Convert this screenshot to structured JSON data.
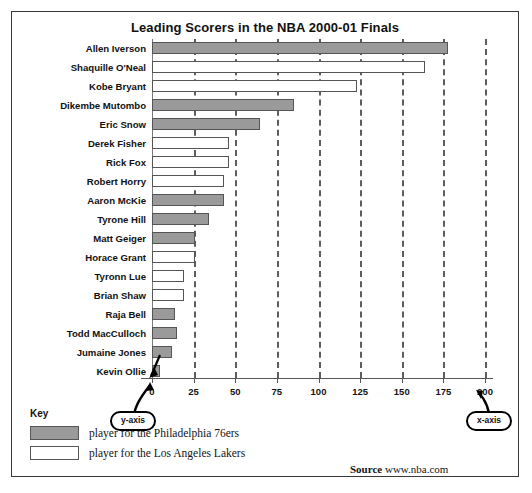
{
  "chart_data": {
    "type": "bar",
    "orientation": "horizontal",
    "title": "Leading Scorers in the NBA 2000-01 Finals",
    "xlabel": "",
    "ylabel": "",
    "xlim": [
      0,
      200
    ],
    "xticks": [
      0,
      25,
      50,
      75,
      100,
      125,
      150,
      175,
      200
    ],
    "grid": "vertical dashed gridlines at each x tick",
    "legend_position": "bottom-left",
    "categories": [
      "Allen Iverson",
      "Shaquille O'Neal",
      "Kobe Bryant",
      "Dikembe Mutombo",
      "Eric Snow",
      "Derek Fisher",
      "Rick Fox",
      "Robert Horry",
      "Aaron McKie",
      "Tyrone Hill",
      "Matt Geiger",
      "Horace Grant",
      "Tyronn Lue",
      "Brian Shaw",
      "Raja Bell",
      "Todd MacCulloch",
      "Jumaine Jones",
      "Kevin Ollie"
    ],
    "values": [
      178,
      164,
      123,
      85,
      65,
      46,
      46,
      43,
      43,
      34,
      26,
      26,
      19,
      19,
      14,
      15,
      12,
      5
    ],
    "teams": [
      "sixers",
      "lakers",
      "lakers",
      "sixers",
      "sixers",
      "lakers",
      "lakers",
      "lakers",
      "sixers",
      "sixers",
      "sixers",
      "lakers",
      "lakers",
      "lakers",
      "sixers",
      "sixers",
      "sixers",
      "sixers"
    ],
    "bars": [
      {
        "label": "Allen Iverson",
        "value": 178,
        "team": "sixers"
      },
      {
        "label": "Shaquille O'Neal",
        "value": 164,
        "team": "lakers"
      },
      {
        "label": "Kobe Bryant",
        "value": 123,
        "team": "lakers"
      },
      {
        "label": "Dikembe Mutombo",
        "value": 85,
        "team": "sixers"
      },
      {
        "label": "Eric Snow",
        "value": 65,
        "team": "sixers"
      },
      {
        "label": "Derek Fisher",
        "value": 46,
        "team": "lakers"
      },
      {
        "label": "Rick Fox",
        "value": 46,
        "team": "lakers"
      },
      {
        "label": "Robert Horry",
        "value": 43,
        "team": "lakers"
      },
      {
        "label": "Aaron McKie",
        "value": 43,
        "team": "sixers"
      },
      {
        "label": "Tyrone Hill",
        "value": 34,
        "team": "sixers"
      },
      {
        "label": "Matt Geiger",
        "value": 26,
        "team": "sixers"
      },
      {
        "label": "Horace Grant",
        "value": 26,
        "team": "lakers"
      },
      {
        "label": "Tyronn Lue",
        "value": 19,
        "team": "lakers"
      },
      {
        "label": "Brian Shaw",
        "value": 19,
        "team": "lakers"
      },
      {
        "label": "Raja Bell",
        "value": 14,
        "team": "sixers"
      },
      {
        "label": "Todd MacCulloch",
        "value": 15,
        "team": "sixers"
      },
      {
        "label": "Jumaine Jones",
        "value": 12,
        "team": "sixers"
      },
      {
        "label": "Kevin Ollie",
        "value": 5,
        "team": "sixers"
      }
    ]
  },
  "key": {
    "title": "Key",
    "entries": [
      {
        "team": "sixers",
        "label": "player for the Philadelphia 76ers",
        "color": "#9a9a9a"
      },
      {
        "team": "lakers",
        "label": "player for the Los Angeles Lakers",
        "color": "#ffffff"
      }
    ]
  },
  "source": {
    "label": "Source",
    "value": "www.nba.com"
  },
  "callouts": {
    "y_axis": "y-axis",
    "x_axis": "x-axis"
  }
}
